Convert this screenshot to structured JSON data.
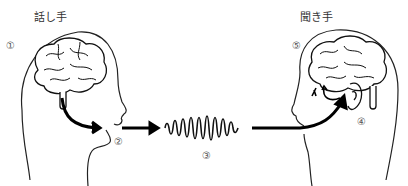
{
  "diagram": {
    "speaker_label": "話し手",
    "listener_label": "聞き手",
    "steps": [
      {
        "marker": "①",
        "meaning": "speaker brain"
      },
      {
        "marker": "②",
        "meaning": "speaker mouth"
      },
      {
        "marker": "③",
        "meaning": "sound wave"
      },
      {
        "marker": "④",
        "meaning": "listener ear"
      },
      {
        "marker": "⑤",
        "meaning": "listener brain"
      }
    ],
    "colors": {
      "stroke": "#111111",
      "text": "#333333",
      "background": "#ffffff"
    }
  }
}
